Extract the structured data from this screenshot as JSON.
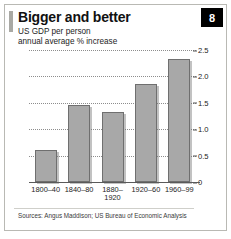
{
  "figure": {
    "title": "Bigger and better",
    "subtitle_line1": "US GDP per person",
    "subtitle_line2": "annual average % increase",
    "badge_number": "8",
    "source": "Sources: Angus Maddison; US Bureau of Economic Analysis",
    "colors": {
      "bar_fill": "#a8a8a8",
      "bar_border": "#6f6f6f",
      "badge_background": "#000000",
      "badge_text": "#ffffff",
      "accent": "#a9a9a4",
      "gridline": "#8d8d8d",
      "axis": "#5a5a5a",
      "frame": "#b9b9b4"
    }
  },
  "chart_data": {
    "type": "bar",
    "title": "Bigger and better",
    "subtitle": "US GDP per person annual average % increase",
    "categories": [
      "1800–40",
      "1840–80",
      "1880–1920",
      "1920–60",
      "1960–99"
    ],
    "category_lines": [
      [
        "1800–40"
      ],
      [
        "1840–80"
      ],
      [
        "1880–",
        "1920"
      ],
      [
        "1920–60"
      ],
      [
        "1960–99"
      ]
    ],
    "values": [
      0.6,
      1.45,
      1.33,
      1.85,
      2.33
    ],
    "xlabel": "",
    "ylabel": "",
    "ylim": [
      0,
      2.5
    ],
    "yticks": [
      0,
      0.5,
      1.0,
      1.5,
      2.0,
      2.5
    ],
    "ytick_labels": [
      "0",
      "0.5",
      "1.0",
      "1.5",
      "2.0",
      "2.5"
    ],
    "grid": true,
    "legend": false,
    "source": "Sources: Angus Maddison; US Bureau of Economic Analysis"
  }
}
